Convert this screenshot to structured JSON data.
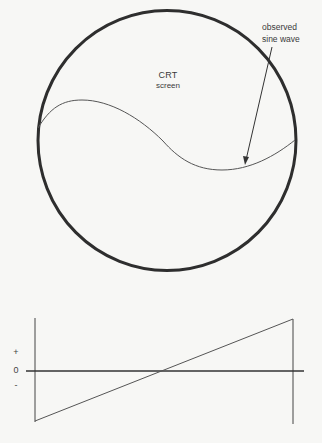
{
  "crt": {
    "title_line1": "CRT",
    "title_line2": "screen",
    "annotation_line1": "observed",
    "annotation_line2": "sine wave"
  },
  "sweep_graph": {
    "tick_plus": "+",
    "tick_zero": "0",
    "tick_minus": "-"
  },
  "colors": {
    "background": "#f7f7f5",
    "stroke": "#2e2e2e"
  }
}
